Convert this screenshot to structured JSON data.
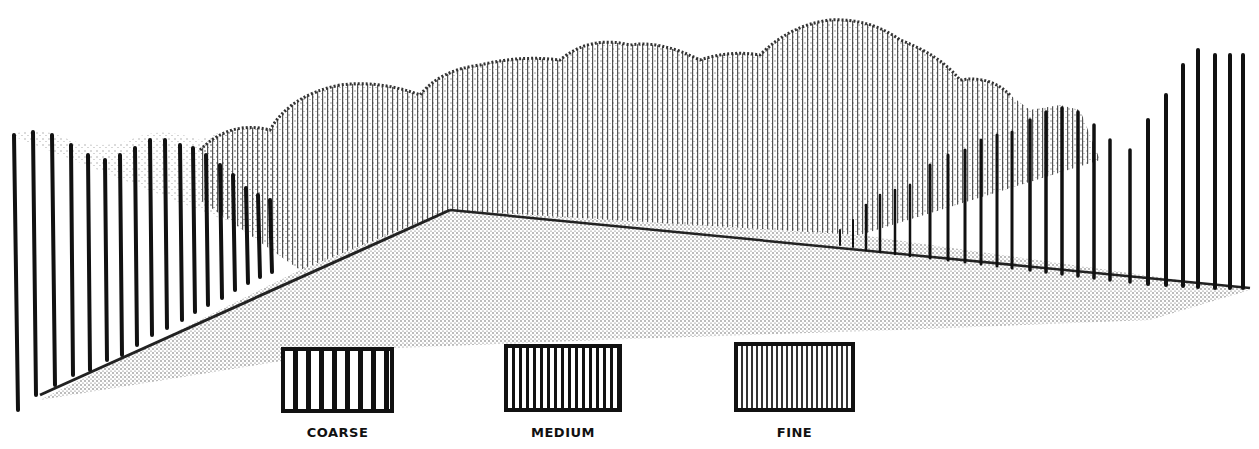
{
  "figure": {
    "scene": {
      "left_fence": {
        "texture": "coarse",
        "slat_color": "#111111"
      },
      "background_foliage": {
        "texture": "fine",
        "style": "stippled"
      },
      "right_fence": {
        "texture": "coarse",
        "slat_color": "#111111"
      },
      "ground": {
        "style": "stippled"
      }
    },
    "legend": {
      "items": [
        {
          "label": "COARSE",
          "spacing": 13,
          "stroke": 5
        },
        {
          "label": "MEDIUM",
          "spacing": 7,
          "stroke": 3
        },
        {
          "label": "FINE",
          "spacing": 5,
          "stroke": 2
        }
      ]
    }
  }
}
